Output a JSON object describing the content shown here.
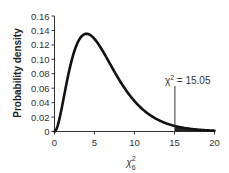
{
  "chart_data": {
    "type": "line",
    "title": "",
    "xlabel": "χ²₆",
    "xlabel_base": "χ",
    "xlabel_sup": "2",
    "xlabel_sub": "6",
    "ylabel": "Probability density",
    "xlim": [
      0,
      20
    ],
    "ylim": [
      0,
      0.16
    ],
    "x_ticks": [
      0,
      5,
      10,
      15,
      20
    ],
    "x_tick_labels": [
      "0",
      "5",
      "10",
      "15",
      "20"
    ],
    "y_ticks": [
      0,
      0.02,
      0.04,
      0.06,
      0.08,
      0.1,
      0.12,
      0.14,
      0.16
    ],
    "y_tick_labels": [
      "0",
      "0.02",
      "0.04",
      "0.06",
      "0.08",
      "0.10",
      "0.12",
      "0.14",
      "0.16"
    ],
    "grid": false,
    "series": [
      {
        "name": "Chi-square pdf, df = 6",
        "distribution": "chi-square",
        "df": 6,
        "x": [
          0,
          1,
          2,
          3,
          4,
          5,
          6,
          7,
          8,
          9,
          10,
          11,
          12,
          13,
          14,
          15,
          16,
          17,
          18,
          19,
          20
        ],
        "values": [
          0,
          0.0379,
          0.092,
          0.1255,
          0.1353,
          0.1283,
          0.112,
          0.0925,
          0.0733,
          0.0562,
          0.0421,
          0.0309,
          0.0223,
          0.0159,
          0.0112,
          0.0079,
          0.0054,
          0.0037,
          0.0025,
          0.0017,
          0.0011
        ]
      }
    ],
    "annotations": [
      {
        "type": "vline",
        "x": 15.05,
        "label": "χ² = 15.05",
        "label_base": "χ",
        "label_sup": "2",
        "label_rest": " = 15.05"
      },
      {
        "type": "shaded_area",
        "from": 15.05,
        "to": 20,
        "color": "#222222"
      }
    ],
    "colors": {
      "curve": "#111111",
      "axis": "#333333",
      "shade": "#222222"
    }
  }
}
